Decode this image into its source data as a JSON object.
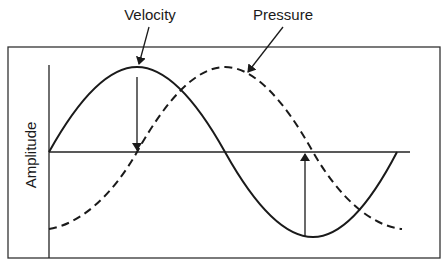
{
  "diagram": {
    "type": "wave-phase-diagram",
    "y_axis_label": "Amplitude",
    "series": [
      {
        "name": "Velocity",
        "style": "solid",
        "phase": "sine",
        "label": "Velocity"
      },
      {
        "name": "Pressure",
        "style": "dashed",
        "phase": "-cosine (lags 90°)",
        "label": "Pressure"
      }
    ],
    "annotations": [
      {
        "type": "arrow",
        "from": "velocity peak",
        "to": "zero crossing",
        "direction": "down"
      },
      {
        "type": "arrow",
        "from": "velocity trough",
        "to": "zero crossing",
        "direction": "up"
      }
    ],
    "colors": {
      "line": "#1a1a1a",
      "background": "#ffffff",
      "frame": "#333333"
    }
  }
}
